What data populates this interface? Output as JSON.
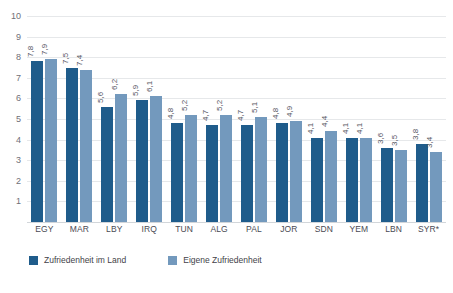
{
  "chart_data": {
    "type": "bar",
    "title": "",
    "xlabel": "",
    "ylabel": "",
    "ylim": [
      0,
      10
    ],
    "ytick_labels": [
      "10",
      "9",
      "8",
      "7",
      "6",
      "5",
      "4",
      "3",
      "2",
      "1"
    ],
    "grid": true,
    "legend_position": "bottom-left",
    "categories": [
      "EGY",
      "MAR",
      "LBY",
      "IRQ",
      "TUN",
      "ALG",
      "PAL",
      "JOR",
      "SDN",
      "YEM",
      "LBN",
      "SYR*"
    ],
    "series": [
      {
        "name": "Zufriedenheit im Land",
        "color": "#1f5c8b",
        "values": [
          7.8,
          7.5,
          5.6,
          5.9,
          4.8,
          4.7,
          4.7,
          4.8,
          4.1,
          4.1,
          3.6,
          3.8
        ],
        "labels": [
          "7,8",
          "7,5",
          "5,6",
          "5,9",
          "4,8",
          "4,7",
          "4,7",
          "4,8",
          "4,1",
          "4,1",
          "3,6",
          "3,8"
        ]
      },
      {
        "name": "Eigene Zufriedenheit",
        "color": "#7399bd",
        "values": [
          7.9,
          7.4,
          6.2,
          6.1,
          5.2,
          5.2,
          5.1,
          4.9,
          4.4,
          4.1,
          3.5,
          3.4
        ],
        "labels": [
          "7,9",
          "7,4",
          "6,2",
          "6,1",
          "5,2",
          "5,2",
          "5,1",
          "4,9",
          "4,4",
          "4,1",
          "3,5",
          "3,4"
        ]
      }
    ]
  },
  "legend": {
    "items": [
      {
        "label": "Zufriedenheit im Land"
      },
      {
        "label": "Eigene Zufriedenheit"
      }
    ]
  }
}
